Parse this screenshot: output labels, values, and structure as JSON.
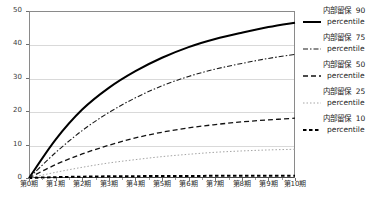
{
  "chart_data": {
    "type": "line",
    "title": "",
    "xlabel": "",
    "ylabel": "",
    "ylim": [
      0,
      50
    ],
    "yticks": [
      0,
      10,
      20,
      30,
      40,
      50
    ],
    "grid": true,
    "legend_position": "right",
    "categories": [
      "第0期",
      "第1期",
      "第2期",
      "第3期",
      "第4期",
      "第5期",
      "第6期",
      "第7期",
      "第8期",
      "第9期",
      "第10期"
    ],
    "series": [
      {
        "name": "内部留保 90 percentile",
        "label_main": "内部留保",
        "label_value": "90",
        "label_unit": "percentile",
        "style": "solid",
        "color": "#000000",
        "width": 2.0,
        "values": [
          0,
          11.5,
          20.5,
          27.0,
          32.0,
          36.0,
          39.2,
          41.6,
          43.5,
          45.2,
          46.5
        ]
      },
      {
        "name": "内部留保 75 percentile",
        "label_main": "内部留保",
        "label_value": "75",
        "label_unit": "percentile",
        "style": "dashdot",
        "color": "#1a1a1a",
        "width": 1.1,
        "values": [
          0,
          7.6,
          14.2,
          19.6,
          24.0,
          27.6,
          30.4,
          32.6,
          34.3,
          35.8,
          37.0
        ]
      },
      {
        "name": "内部留保 50 percentile",
        "label_main": "内部留保",
        "label_value": "50",
        "label_unit": "percentile",
        "style": "dashed",
        "color": "#111111",
        "width": 1.3,
        "values": [
          0,
          4.0,
          7.2,
          9.8,
          12.0,
          13.7,
          15.0,
          16.0,
          16.8,
          17.4,
          17.9
        ]
      },
      {
        "name": "内部留保 25 percentile",
        "label_main": "内部留保",
        "label_value": "25",
        "label_unit": "percentile",
        "style": "dotted",
        "color": "#a5a5a5",
        "width": 1.0,
        "values": [
          0,
          1.7,
          3.2,
          4.5,
          5.5,
          6.4,
          7.1,
          7.7,
          8.1,
          8.4,
          8.6
        ]
      },
      {
        "name": "内部留保 10 percentile",
        "label_main": "内部留保",
        "label_value": "10",
        "label_unit": "percentile",
        "style": "thick-dash",
        "color": "#000000",
        "width": 2.0,
        "values": [
          0,
          0.25,
          0.4,
          0.5,
          0.55,
          0.6,
          0.62,
          0.65,
          0.67,
          0.68,
          0.7
        ]
      }
    ]
  },
  "axes": {
    "y_tick_labels": [
      "0",
      "10",
      "20",
      "30",
      "40",
      "50"
    ],
    "x_tick_labels": [
      "第0期",
      "第1期",
      "第2期",
      "第3期",
      "第4期",
      "第5期",
      "第6期",
      "第7期",
      "第8期",
      "第9期",
      "第10期"
    ]
  },
  "legend": {
    "items": [
      {
        "main": "内部留保",
        "value": "90",
        "unit": "percentile",
        "style": "solid"
      },
      {
        "main": "内部留保",
        "value": "75",
        "unit": "percentile",
        "style": "dashdot"
      },
      {
        "main": "内部留保",
        "value": "50",
        "unit": "percentile",
        "style": "dashed"
      },
      {
        "main": "内部留保",
        "value": "25",
        "unit": "percentile",
        "style": "dotted"
      },
      {
        "main": "内部留保",
        "value": "10",
        "unit": "percentile",
        "style": "thick-dash"
      }
    ]
  },
  "colors": {
    "background": "#ffffff",
    "gridline": "#d9d9d9",
    "axis": "#6e6e6e",
    "text": "#1a1a1a",
    "faint_series": "#a5a5a5"
  }
}
